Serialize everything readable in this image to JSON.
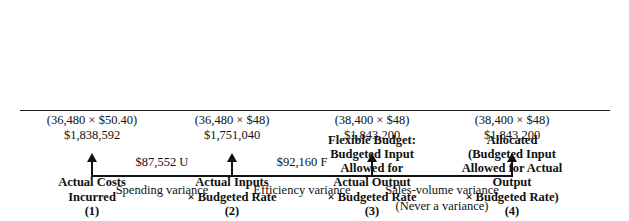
{
  "diagram": {
    "title_none": "",
    "columns": [
      {
        "header_lines": [
          "Actual Costs",
          "Incurred"
        ],
        "number": "(1)",
        "values": [
          "(36,480 × $50.40)",
          "$1,838,592"
        ]
      },
      {
        "header_lines": [
          "Actual Inputs",
          "× Budgeted Rate"
        ],
        "number": "(2)",
        "values": [
          "(36,480 × $48)",
          "$1,751,040"
        ]
      },
      {
        "header_lines": [
          "Flexible Budget:",
          "Budgeted Input",
          "Allowed for",
          "Actual Output",
          "× Budgeted Rate"
        ],
        "number": "(3)",
        "values": [
          "(38,400 × $48)",
          "$1,843,200"
        ]
      },
      {
        "header_lines": [
          "Allocated",
          "(Budgeted Input",
          "Allowed for Actual",
          "Output",
          "× Budgeted Rate)"
        ],
        "number": "(4)",
        "values": [
          "(38,400 × $48)",
          "$1,843,200"
        ]
      }
    ],
    "connectors": [
      {
        "amount": "$87,552 U"
      },
      {
        "amount": "$92,160 F"
      },
      {
        "amount": ""
      }
    ],
    "variance_labels": [
      {
        "lines": [
          "Spending variance"
        ]
      },
      {
        "lines": [
          "Efficiency variance"
        ]
      },
      {
        "lines": [
          "Sales-volume variance",
          "(Never a variance)"
        ]
      }
    ],
    "colors": {
      "background": "#ffffff",
      "text": "#111111",
      "rule": "#1a1a1a"
    }
  }
}
